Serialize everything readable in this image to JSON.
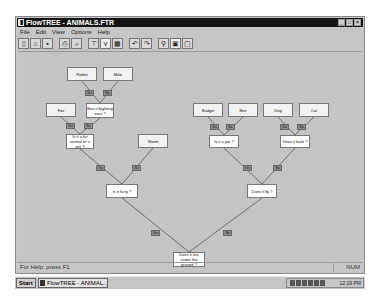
{
  "window": {
    "title": "FlowTREE - ANIMALS.FTR",
    "app_icon": "▮",
    "controls": {
      "minimize": "_",
      "maximize": "□",
      "close": "×"
    }
  },
  "menu": [
    "File",
    "Edit",
    "View",
    "Options",
    "Help"
  ],
  "toolbar": [
    {
      "name": "new-icon",
      "glyph": "▯"
    },
    {
      "name": "open-icon",
      "glyph": "⌂"
    },
    {
      "name": "save-icon",
      "glyph": "▪"
    },
    {
      "sep": true
    },
    {
      "name": "print-icon",
      "glyph": "⎙"
    },
    {
      "name": "print-preview-icon",
      "glyph": "⌕"
    },
    {
      "sep": true
    },
    {
      "name": "tree-icon",
      "glyph": "⊤"
    },
    {
      "name": "branch-icon",
      "glyph": "⋎",
      "pressed": true
    },
    {
      "name": "grid-icon",
      "glyph": "▦"
    },
    {
      "sep": true
    },
    {
      "name": "undo-icon",
      "glyph": "↶"
    },
    {
      "name": "redo-icon",
      "glyph": "↷"
    },
    {
      "sep": true
    },
    {
      "name": "zoom-icon",
      "glyph": "⚲"
    },
    {
      "name": "fit-icon",
      "glyph": "▣",
      "pressed": true
    },
    {
      "name": "frame-icon",
      "glyph": "▢"
    }
  ],
  "tree": {
    "nodes": [
      {
        "id": "rabbit",
        "label": "Rabbit",
        "x": 49,
        "y": 15,
        "w": 30,
        "h": 14,
        "type": "leaf"
      },
      {
        "id": "mole",
        "label": "Mole",
        "x": 85,
        "y": 15,
        "w": 30,
        "h": 14,
        "type": "leaf"
      },
      {
        "id": "fox",
        "label": "Fox",
        "x": 28,
        "y": 51,
        "w": 30,
        "h": 14,
        "type": "leaf"
      },
      {
        "id": "q_ears",
        "label": "Has it big/long ears ?",
        "x": 68,
        "y": 51,
        "w": 28,
        "h": 15,
        "type": "question"
      },
      {
        "id": "q_pet",
        "label": "Is it a fur animal or a pet ?",
        "x": 48,
        "y": 82,
        "w": 28,
        "h": 15,
        "type": "question"
      },
      {
        "id": "worm",
        "label": "Worm",
        "x": 120,
        "y": 82,
        "w": 30,
        "h": 14,
        "type": "leaf"
      },
      {
        "id": "q_furry",
        "label": "Is it furry ?",
        "x": 88,
        "y": 132,
        "w": 32,
        "h": 14,
        "type": "question"
      },
      {
        "id": "budgie",
        "label": "Budgie",
        "x": 175,
        "y": 51,
        "w": 30,
        "h": 14,
        "type": "leaf"
      },
      {
        "id": "bee",
        "label": "Bee",
        "x": 210,
        "y": 51,
        "w": 30,
        "h": 14,
        "type": "leaf"
      },
      {
        "id": "dog",
        "label": "Dog",
        "x": 245,
        "y": 51,
        "w": 30,
        "h": 14,
        "type": "leaf"
      },
      {
        "id": "cat",
        "label": "Cat",
        "x": 281,
        "y": 51,
        "w": 30,
        "h": 14,
        "type": "leaf"
      },
      {
        "id": "q_fly",
        "label": "Is it a pet ?",
        "x": 191,
        "y": 83,
        "w": 30,
        "h": 13,
        "type": "question"
      },
      {
        "id": "q_bark",
        "label": "Does it bark ?",
        "x": 262,
        "y": 83,
        "w": 30,
        "h": 13,
        "type": "question"
      },
      {
        "id": "q_fly2",
        "label": "Does it fly ?",
        "x": 229,
        "y": 132,
        "w": 30,
        "h": 14,
        "type": "question"
      },
      {
        "id": "root",
        "label": "Does it live under the ground ?",
        "x": 155,
        "y": 200,
        "w": 32,
        "h": 15,
        "type": "question"
      }
    ],
    "edges": [
      {
        "from": "q_ears",
        "to": "rabbit",
        "label": "Yes",
        "lx": 67,
        "ly": 38
      },
      {
        "from": "q_ears",
        "to": "mole",
        "label": "No",
        "lx": 85,
        "ly": 38
      },
      {
        "from": "q_pet",
        "to": "fox",
        "label": "Yes",
        "lx": 48,
        "ly": 71
      },
      {
        "from": "q_pet",
        "to": "q_ears",
        "label": "No",
        "lx": 66,
        "ly": 71
      },
      {
        "from": "q_furry",
        "to": "q_pet",
        "label": "Yes",
        "lx": 78,
        "ly": 113
      },
      {
        "from": "q_furry",
        "to": "worm",
        "label": "No",
        "lx": 114,
        "ly": 113
      },
      {
        "from": "q_fly",
        "to": "budgie",
        "label": "Yes",
        "lx": 192,
        "ly": 72
      },
      {
        "from": "q_fly",
        "to": "bee",
        "label": "No",
        "lx": 208,
        "ly": 72
      },
      {
        "from": "q_bark",
        "to": "dog",
        "label": "Yes",
        "lx": 262,
        "ly": 72
      },
      {
        "from": "q_bark",
        "to": "cat",
        "label": "No",
        "lx": 279,
        "ly": 72
      },
      {
        "from": "q_fly2",
        "to": "q_fly",
        "label": "Yes",
        "lx": 225,
        "ly": 113
      },
      {
        "from": "q_fly2",
        "to": "q_bark",
        "label": "No",
        "lx": 255,
        "ly": 113
      },
      {
        "from": "root",
        "to": "q_furry",
        "label": "Yes",
        "lx": 133,
        "ly": 178
      },
      {
        "from": "root",
        "to": "q_fly2",
        "label": "No",
        "lx": 205,
        "ly": 178
      }
    ]
  },
  "status": {
    "help_text": "For Help, press F1",
    "num_indicator": "NUM"
  },
  "taskbar": {
    "start_label": "Start",
    "task_label": "FlowTREE - ANIMAL...",
    "clock": "12:19 PM"
  },
  "colors": {
    "titlebar": "#141414",
    "canvas": "#c4c4c4",
    "node_leaf": "#f2f2f2",
    "node_question": "#ffffff",
    "edge_label": "#8c8c8c",
    "edge_line": "#6e6e6e"
  }
}
